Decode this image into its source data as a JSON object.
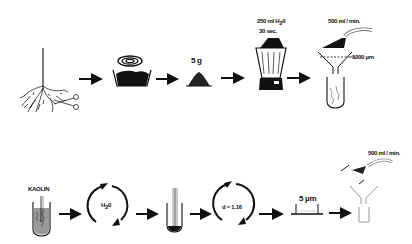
{
  "diagram": {
    "type": "process-flow",
    "row1": {
      "steps": [
        {
          "id": "root-harvest",
          "label": ""
        },
        {
          "id": "drying-heating",
          "label": ""
        },
        {
          "id": "weigh-sample",
          "label": "5 g"
        },
        {
          "id": "blend",
          "label_line1": "250 ml H",
          "label_sub": "2",
          "label_tail": "0",
          "label_line2": "30 sec."
        },
        {
          "id": "sieve-wash",
          "label_flow": "500 ml / min.",
          "label_mesh": "1200 µm"
        }
      ]
    },
    "row2": {
      "steps": [
        {
          "id": "kaolin-tube",
          "label": "KAOLIN"
        },
        {
          "id": "centrifuge-water",
          "label_main": "H",
          "label_sub": "2",
          "label_tail": "0"
        },
        {
          "id": "pellet-tube",
          "label": ""
        },
        {
          "id": "centrifuge-density",
          "label": "d = 1.16"
        },
        {
          "id": "sieve-5um",
          "label": "5 µm"
        },
        {
          "id": "rinse-collect",
          "label_flow": "500 ml / min."
        }
      ]
    },
    "arrow_count_row1": 4,
    "arrow_count_row2": 5,
    "ink_color": "#111111",
    "background": "#ffffff"
  }
}
